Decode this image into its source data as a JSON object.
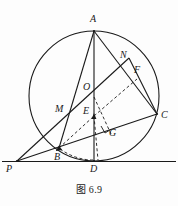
{
  "figure": {
    "caption": "图 6.9",
    "stroke_color": "#1a1a1a",
    "background_color": "#fdfdfd",
    "labels": [
      {
        "name": "A",
        "text": "A",
        "x": 90,
        "y": 14
      },
      {
        "name": "N",
        "text": "N",
        "x": 120,
        "y": 50
      },
      {
        "name": "F",
        "text": "F",
        "x": 134,
        "y": 65
      },
      {
        "name": "O",
        "text": "O",
        "x": 83,
        "y": 82
      },
      {
        "name": "M",
        "text": "M",
        "x": 55,
        "y": 104
      },
      {
        "name": "E",
        "text": "E",
        "x": 83,
        "y": 106
      },
      {
        "name": "C",
        "text": "C",
        "x": 161,
        "y": 110
      },
      {
        "name": "G",
        "text": "G",
        "x": 109,
        "y": 128
      },
      {
        "name": "B",
        "text": "B",
        "x": 54,
        "y": 152
      },
      {
        "name": "D",
        "text": "D",
        "x": 90,
        "y": 164
      },
      {
        "name": "P",
        "text": "P",
        "x": 6,
        "y": 164
      }
    ],
    "circle": {
      "cx": 94,
      "cy": 96,
      "r": 65
    },
    "points": {
      "A": {
        "x": 94,
        "y": 31
      },
      "N": {
        "x": 126,
        "y": 62
      },
      "F": {
        "x": 133,
        "y": 78
      },
      "O": {
        "x": 94,
        "y": 96
      },
      "M": {
        "x": 67,
        "y": 112
      },
      "E": {
        "x": 94,
        "y": 116
      },
      "C": {
        "x": 157,
        "y": 114
      },
      "G": {
        "x": 107,
        "y": 131
      },
      "B": {
        "x": 59,
        "y": 148
      },
      "D": {
        "x": 94,
        "y": 161
      },
      "P": {
        "x": 17,
        "y": 161
      }
    },
    "solid_segments": [
      {
        "name": "segment-A-D",
        "from": "A",
        "to": "D"
      },
      {
        "name": "segment-A-B",
        "from": "A",
        "to": "B"
      },
      {
        "name": "segment-A-C",
        "from": "A",
        "to": "C"
      },
      {
        "name": "segment-P-C",
        "from": "P",
        "to": "C"
      },
      {
        "name": "segment-P-N",
        "from": "P",
        "to": "N"
      },
      {
        "name": "segment-N-C",
        "from": "N",
        "to": "C"
      },
      {
        "name": "segment-B-C",
        "from": "B",
        "to": "C"
      },
      {
        "name": "segment-P-baseline",
        "from": "P",
        "to": "baseline-right"
      }
    ],
    "dashed_segments": [
      {
        "name": "segment-B-E",
        "from": "B",
        "to": "E"
      },
      {
        "name": "segment-O-F",
        "from": "O",
        "to": "F"
      },
      {
        "name": "segment-E-G",
        "from": "E",
        "to": "G"
      },
      {
        "name": "segment-O-D",
        "from": "O",
        "to": "D"
      },
      {
        "name": "segment-B-D-arc",
        "from": "B",
        "to": "D"
      },
      {
        "name": "segment-E-D",
        "from": "E",
        "to": "D"
      }
    ],
    "right_angle_mark": {
      "name": "right-angle-at-G",
      "x": 107,
      "y": 131
    },
    "baseline": {
      "name": "tangent-line-P-D",
      "x1": 2,
      "y1": 161,
      "x2": 176,
      "y2": 161
    }
  }
}
